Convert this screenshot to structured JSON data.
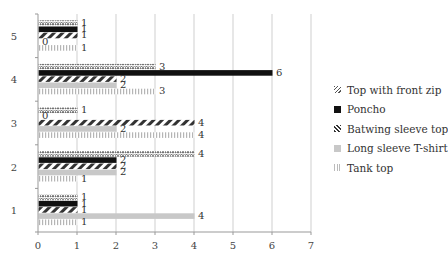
{
  "chart_data": {
    "type": "bar",
    "orientation": "horizontal",
    "title": "",
    "xlabel": "",
    "ylabel": "",
    "categories": [
      "1",
      "2",
      "3",
      "4",
      "5"
    ],
    "xlim": [
      0,
      7
    ],
    "x_ticks": [
      "0",
      "1",
      "2",
      "3",
      "4",
      "5",
      "6",
      "7"
    ],
    "grid": "vertical",
    "legend_position": "right",
    "series": [
      {
        "name": "Top with front zip",
        "pattern": "dotted-zigzag",
        "color": "#555555",
        "values": [
          1,
          4,
          1,
          3,
          1
        ]
      },
      {
        "name": "Poncho",
        "pattern": "solid",
        "color": "#111111",
        "values": [
          1,
          2,
          0,
          6,
          1
        ]
      },
      {
        "name": "Batwing sleeve top",
        "pattern": "diagonal-stripes",
        "color": "#333333",
        "values": [
          1,
          2,
          4,
          2,
          1
        ]
      },
      {
        "name": "Long sleeve T-shirt",
        "pattern": "solid-light",
        "color": "#c8c8c8",
        "values": [
          4,
          2,
          2,
          2,
          0
        ]
      },
      {
        "name": "Tank top",
        "pattern": "vertical-stripes",
        "color": "#bbbbbb",
        "values": [
          1,
          1,
          4,
          3,
          1
        ]
      }
    ]
  },
  "legend": {
    "items": [
      {
        "label": "Top with front zip"
      },
      {
        "label": "Poncho"
      },
      {
        "label": "Batwing sleeve top"
      },
      {
        "label": "Long sleeve T-shirt"
      },
      {
        "label": "Tank top"
      }
    ]
  }
}
